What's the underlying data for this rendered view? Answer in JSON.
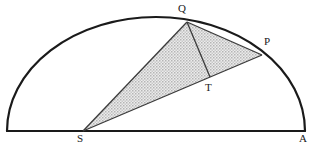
{
  "figure": {
    "kind": "geometry-diagram",
    "canvas": {
      "width": 316,
      "height": 151
    },
    "colors": {
      "stroke": "#1a1a1a",
      "thin_stroke": "#3b3b3b",
      "shade_fill": "#d9d9d9",
      "shade_dot": "#8c8c8c",
      "background": "#ffffff",
      "label_color": "#1a1a1a"
    },
    "arc": {
      "name": "semicircular-arc",
      "center_x": 156,
      "baseline_y": 131,
      "radius_x": 149,
      "radius_y": 114,
      "stroke_width": 2.2
    },
    "baseline": {
      "name": "diameter-baseline",
      "x1": 7,
      "y1": 131,
      "x2": 305,
      "y2": 131,
      "stroke_width": 2.2
    },
    "points": [
      {
        "id": "Q",
        "label": "Q",
        "x": 187,
        "y": 22,
        "label_x": 178,
        "label_y": 3
      },
      {
        "id": "P",
        "label": "P",
        "x": 262,
        "y": 55,
        "label_x": 264,
        "label_y": 36
      },
      {
        "id": "T",
        "label": "T",
        "x": 210,
        "y": 77,
        "label_x": 205,
        "label_y": 82
      },
      {
        "id": "S",
        "label": "S",
        "x": 83,
        "y": 131,
        "label_x": 77,
        "label_y": 133
      },
      {
        "id": "A",
        "label": "A",
        "x": 305,
        "y": 131,
        "label_x": 299,
        "label_y": 133
      }
    ],
    "shaded_region": {
      "name": "triangle-SQP",
      "vertices": "83,131 187,22 262,55",
      "fill_pattern": "dotted-gray"
    },
    "segments": [
      {
        "id": "SQ",
        "from": "S",
        "to": "Q",
        "x1": 83,
        "y1": 131,
        "x2": 187,
        "y2": 22,
        "width": 1.3
      },
      {
        "id": "SP",
        "from": "S",
        "to": "P",
        "x1": 83,
        "y1": 131,
        "x2": 262,
        "y2": 55,
        "width": 1.3
      },
      {
        "id": "QP",
        "from": "Q",
        "to": "P",
        "x1": 187,
        "y1": 22,
        "x2": 262,
        "y2": 55,
        "width": 1.3
      },
      {
        "id": "QT",
        "from": "Q",
        "to": "T",
        "x1": 187,
        "y1": 22,
        "x2": 210,
        "y2": 77,
        "width": 1.3
      }
    ]
  }
}
